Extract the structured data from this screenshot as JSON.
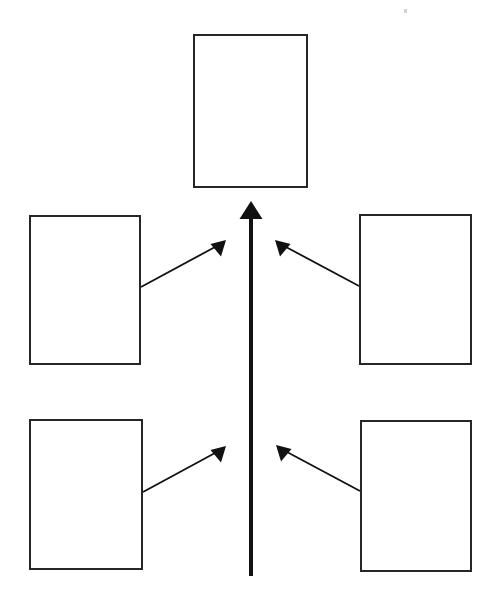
{
  "page": {
    "background_color": "#ffffff",
    "width": 501,
    "height": 606
  },
  "diagram": {
    "type": "converging-arrow concept map",
    "stroke_color": "#262626",
    "fill_color": "#ffffff",
    "boxes": [
      {
        "id": "top-box",
        "label": "",
        "x": 193,
        "y": 34,
        "width": 115,
        "height": 154,
        "role": "result"
      },
      {
        "id": "left-upper-box",
        "label": "",
        "x": 29,
        "y": 215,
        "width": 112,
        "height": 150,
        "role": "contributing-factor"
      },
      {
        "id": "right-upper-box",
        "label": "",
        "x": 359,
        "y": 214,
        "width": 113,
        "height": 151,
        "role": "contributing-factor"
      },
      {
        "id": "left-lower-box",
        "label": "",
        "x": 29,
        "y": 419,
        "width": 114,
        "height": 151,
        "role": "contributing-factor"
      },
      {
        "id": "right-lower-box",
        "label": "",
        "x": 360,
        "y": 420,
        "width": 112,
        "height": 152,
        "role": "contributing-factor"
      }
    ],
    "arrows": [
      {
        "id": "spine-arrow",
        "label": "",
        "from": {
          "x": 251,
          "y": 576
        },
        "to": {
          "x": 251,
          "y": 202
        },
        "direction": "up",
        "stroke_width": 4,
        "head_width": 21,
        "head_length": 17
      },
      {
        "id": "left-upper-arrow",
        "label": "",
        "from": {
          "x": 141,
          "y": 287
        },
        "to": {
          "x": 221,
          "y": 243
        },
        "direction": "up-right",
        "stroke_width": 2,
        "head_width": 16,
        "head_length": 16
      },
      {
        "id": "right-upper-arrow",
        "label": "",
        "from": {
          "x": 359,
          "y": 286
        },
        "to": {
          "x": 279,
          "y": 243
        },
        "direction": "up-left",
        "stroke_width": 2,
        "head_width": 16,
        "head_length": 16
      },
      {
        "id": "left-lower-arrow",
        "label": "",
        "from": {
          "x": 143,
          "y": 492
        },
        "to": {
          "x": 221,
          "y": 449
        },
        "direction": "up-right",
        "stroke_width": 2,
        "head_width": 16,
        "head_length": 16
      },
      {
        "id": "right-lower-arrow",
        "label": "",
        "from": {
          "x": 360,
          "y": 491
        },
        "to": {
          "x": 279,
          "y": 448
        },
        "direction": "up-left",
        "stroke_width": 2,
        "head_width": 16,
        "head_length": 16
      }
    ],
    "artifacts": [
      {
        "id": "scan-speck",
        "x": 404,
        "y": 9
      }
    ]
  }
}
